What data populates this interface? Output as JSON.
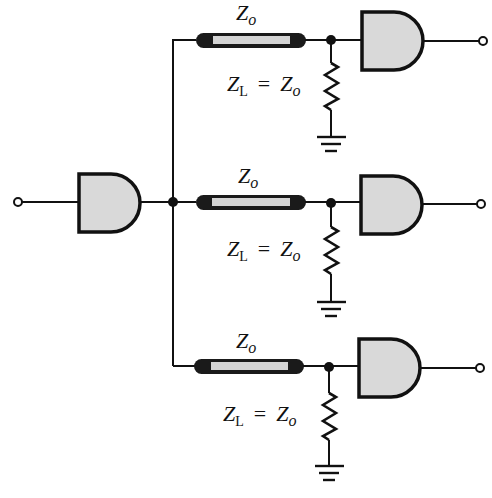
{
  "diagram": {
    "colors": {
      "line": "#111111",
      "gate_fill": "#d9d9d9",
      "coax_inner": "#d4d4d4",
      "background": "#ffffff"
    },
    "driver": {
      "type": "AND gate",
      "input_terminal": "open circle"
    },
    "branches": [
      {
        "line_label_main": "Z",
        "line_label_sub": "o",
        "load_label": {
          "z1": "Z",
          "z1_sub": "L",
          "eq": "=",
          "z2": "Z",
          "z2_sub": "o"
        },
        "receiver": "AND gate",
        "termination": "resistor to ground"
      },
      {
        "line_label_main": "Z",
        "line_label_sub": "o",
        "load_label": {
          "z1": "Z",
          "z1_sub": "L",
          "eq": "=",
          "z2": "Z",
          "z2_sub": "o"
        },
        "receiver": "AND gate",
        "termination": "resistor to ground"
      },
      {
        "line_label_main": "Z",
        "line_label_sub": "o",
        "load_label": {
          "z1": "Z",
          "z1_sub": "L",
          "eq": "=",
          "z2": "Z",
          "z2_sub": "o"
        },
        "receiver": "AND gate",
        "termination": "resistor to ground"
      }
    ]
  }
}
